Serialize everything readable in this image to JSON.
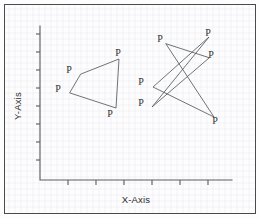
{
  "figure": {
    "background_color": "#fdfdfd",
    "border_color": "#4a4a4a",
    "grid_color": "#e9eaf0",
    "axis_color": "#5a5a5a",
    "line_color": "#555a5f",
    "label_color": "#2f2f2f",
    "width": 260,
    "height": 218
  },
  "chart_data": {
    "type": "scatter",
    "title": "",
    "xlabel": "X-Axis",
    "ylabel": "Y-Axis",
    "grid": true,
    "legend": null,
    "axis": {
      "x_start_px": 40,
      "x_end_px": 232,
      "y_start_px": 26,
      "y_end_px": 180,
      "x_tick_count": 6,
      "y_tick_count": 8,
      "x_tick_labels": [],
      "y_tick_labels": [],
      "x_ticks_px": [
        68,
        96,
        124,
        152,
        180,
        208
      ],
      "y_ticks_px": [
        34,
        52,
        70,
        88,
        106,
        124,
        142,
        160
      ]
    },
    "point_label": "P",
    "shapes": [
      {
        "name": "quadrilateral-left",
        "closed": true,
        "vertex_count": 4,
        "vertices_px": [
          [
            81,
            74
          ],
          [
            119,
            59
          ],
          [
            116,
            108
          ],
          [
            70,
            93
          ]
        ],
        "labels_px": [
          [
            69,
            73
          ],
          [
            118,
            56
          ],
          [
            110,
            117
          ],
          [
            58,
            92
          ]
        ]
      },
      {
        "name": "star-polygon-right",
        "closed": true,
        "vertex_count": 6,
        "vertices_px": [
          [
            166,
            44
          ],
          [
            214,
            117
          ],
          [
            153,
            87
          ],
          [
            209,
            37
          ],
          [
            152,
            107
          ],
          [
            209,
            58
          ]
        ],
        "labels_px": [
          [
            160,
            42
          ],
          [
            215,
            124
          ],
          [
            141,
            85
          ],
          [
            208,
            36
          ],
          [
            141,
            106
          ],
          [
            211,
            58
          ]
        ]
      }
    ]
  },
  "labels": {
    "x_axis_title": "X-Axis",
    "y_axis_title": "Y-Axis",
    "vertex": "P"
  }
}
